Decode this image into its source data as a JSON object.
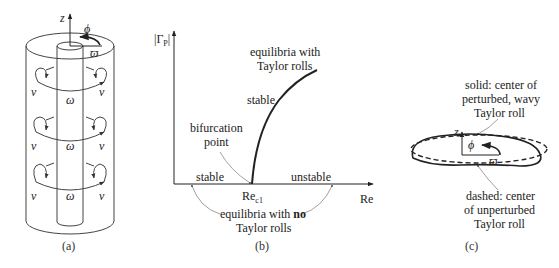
{
  "panel_a": {
    "caption": "(a)",
    "axis_z": "z",
    "axis_phi": "ϕ",
    "axis_varpi": "ϖ",
    "roll_labels": {
      "v": "v",
      "omega": "ω"
    }
  },
  "panel_b": {
    "caption": "(b)",
    "y_axis_label": "|Γ",
    "y_axis_sub": "P",
    "y_axis_close": "|",
    "x_axis_label": "Re",
    "critical_label": "Re",
    "critical_sub": "c1",
    "branch_label_line1": "equilibria with",
    "branch_label_line2": "Taylor rolls",
    "branch_stability": "stable",
    "bifurcation_line1": "bifurcation",
    "bifurcation_line2": "point",
    "left_stability": "stable",
    "right_stability": "unstable",
    "no_rolls_line1_pre": "equilibria with ",
    "no_rolls_line1_bold": "no",
    "no_rolls_line2": "Taylor rolls"
  },
  "panel_c": {
    "caption": "(c)",
    "axis_z": "z",
    "axis_phi": "ϕ",
    "axis_varpi": "ϖ",
    "solid_line1": "solid: center of",
    "solid_line2": "perturbed, wavy",
    "solid_line3": "Taylor roll",
    "dashed_line1": "dashed: center",
    "dashed_line2": "of unperturbed",
    "dashed_line3": "Taylor roll"
  }
}
